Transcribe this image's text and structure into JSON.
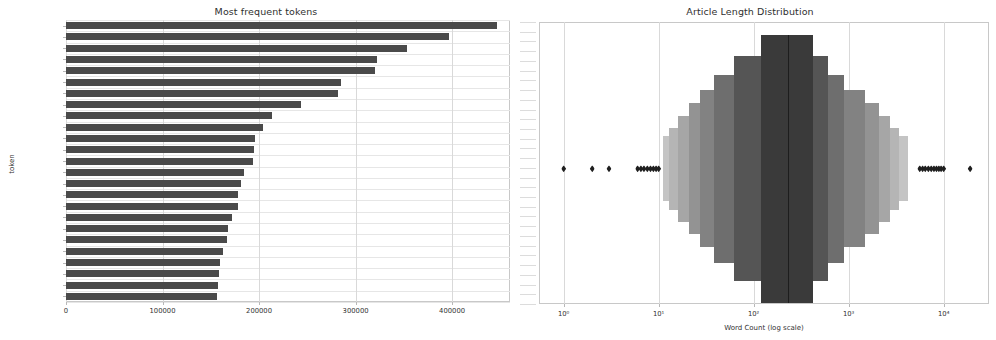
{
  "figure": {
    "width": 996,
    "height": 340,
    "background": "#ffffff",
    "bar_color": "#4a4a4a",
    "boxen_color_dark": "#3a3a3a",
    "boxen_color_mid": "#6e6e6e",
    "boxen_color_light": "#9a9a9a",
    "flier_color": "#1f1f1f",
    "grid_color": "#d9d9d9"
  },
  "chart_data": [
    {
      "type": "bar",
      "orientation": "horizontal",
      "title": "Most frequent tokens",
      "xlabel": "",
      "ylabel": "token",
      "xlim": [
        0,
        460000
      ],
      "xticks": [
        0,
        100000,
        200000,
        300000,
        400000
      ],
      "xticklabels": [
        "0",
        "100000",
        "200000",
        "300000",
        "400000"
      ],
      "grid": true,
      "categories": [
        "company",
        "million",
        "say",
        "net",
        "year",
        "share",
        "income",
        "quarter",
        "include",
        "statement",
        "financial",
        "end",
        "result",
        "cash",
        "expense",
        "operate",
        "market",
        "report",
        "total",
        "reuters",
        "non",
        "new",
        "increase",
        "revenue",
        "loss"
      ],
      "values": [
        447000,
        397000,
        353000,
        322000,
        320000,
        285000,
        282000,
        243000,
        213000,
        204000,
        196000,
        195000,
        194000,
        184000,
        181000,
        178000,
        178000,
        172000,
        168000,
        167000,
        163000,
        160000,
        158000,
        157000,
        156000
      ]
    },
    {
      "type": "boxen",
      "title": "Article Length Distribution",
      "xlabel": "Word Count (log scale)",
      "ylabel": "",
      "xscale": "log",
      "xlim": [
        0.55,
        30000
      ],
      "xticks": [
        1,
        10,
        100,
        1000,
        10000
      ],
      "xticklabels": [
        "10⁰",
        "10¹",
        "10²",
        "10³",
        "10⁴"
      ],
      "grid": true,
      "median": 230,
      "boxes": [
        {
          "lo": 120,
          "hi": 420,
          "depth": 1.0,
          "shade": "#3a3a3a"
        },
        {
          "lo": 62,
          "hi": 600,
          "depth": 0.66,
          "shade": "#555555"
        },
        {
          "lo": 38,
          "hi": 900,
          "depth": 0.43,
          "shade": "#6e6e6e"
        },
        {
          "lo": 27,
          "hi": 1500,
          "depth": 0.28,
          "shade": "#828282"
        },
        {
          "lo": 21,
          "hi": 2100,
          "depth": 0.18,
          "shade": "#939393"
        },
        {
          "lo": 16,
          "hi": 2700,
          "depth": 0.11,
          "shade": "#a6a6a6"
        },
        {
          "lo": 13,
          "hi": 3400,
          "depth": 0.06,
          "shade": "#b5b5b5"
        },
        {
          "lo": 11,
          "hi": 4200,
          "depth": 0.035,
          "shade": "#c4c4c4"
        }
      ],
      "fliers": [
        1,
        2,
        3,
        6.0,
        6.5,
        7.0,
        7.6,
        8.2,
        8.8,
        9.4,
        10.0,
        5600,
        6000,
        6400,
        6900,
        7400,
        7900,
        8400,
        8900,
        9400,
        10000,
        19000
      ]
    }
  ]
}
